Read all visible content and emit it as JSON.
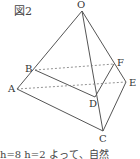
{
  "figure": {
    "title": "図2",
    "caption": "h=8  h=2  よって、自然",
    "labels": {
      "O": "O",
      "A": "A",
      "B": "B",
      "C": "C",
      "D": "D",
      "E": "E",
      "F": "F"
    },
    "colors": {
      "line": "#555555",
      "dashed": "#777777",
      "text": "#333333"
    }
  }
}
